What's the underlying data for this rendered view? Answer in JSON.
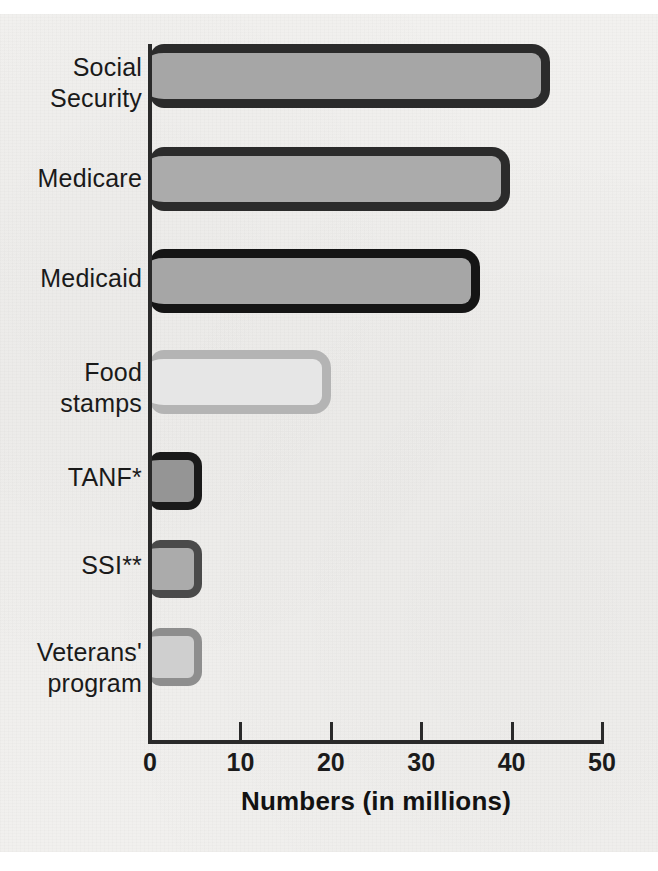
{
  "chart_data": {
    "type": "bar",
    "orientation": "horizontal",
    "title": "",
    "xlabel": "Numbers (in millions)",
    "ylabel": "",
    "xlim": [
      0,
      50
    ],
    "xticks": [
      0,
      10,
      20,
      30,
      40,
      50
    ],
    "xtick_labels": [
      "0",
      "10",
      "20",
      "30",
      "40",
      "50"
    ],
    "grid": false,
    "legend": "none",
    "categories": [
      "Social Security",
      "Medicare",
      "Medicaid",
      "Food stamps",
      "TANF*",
      "SSI**",
      "Veterans' program"
    ],
    "values": [
      44.2,
      39.8,
      36.5,
      20.0,
      5.8,
      5.8,
      5.8
    ],
    "bar_styles": [
      {
        "fill": "#a6a6a6",
        "border": "#2b2b2b"
      },
      {
        "fill": "#ababab",
        "border": "#2b2b2b"
      },
      {
        "fill": "#a6a6a6",
        "border": "#151515"
      },
      {
        "fill": "#e6e6e6",
        "border": "#b4b4b4"
      },
      {
        "fill": "#959595",
        "border": "#1a1a1a"
      },
      {
        "fill": "#ababab",
        "border": "#4a4a4a"
      },
      {
        "fill": "#cfcfcf",
        "border": "#8e8e8e"
      }
    ]
  },
  "axis": {
    "line_color": "#2a2a2a"
  },
  "labels": {
    "category_lines": [
      [
        "Social",
        "Security"
      ],
      [
        "Medicare"
      ],
      [
        "Medicaid"
      ],
      [
        "Food",
        "stamps"
      ],
      [
        "TANF*"
      ],
      [
        "SSI**"
      ],
      [
        "Veterans'",
        "program"
      ]
    ]
  }
}
